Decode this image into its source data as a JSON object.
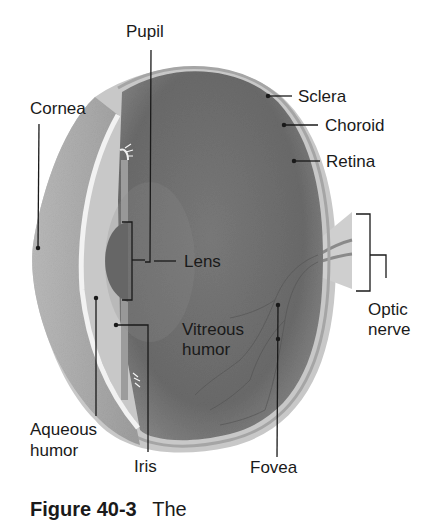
{
  "diagram": {
    "colors": {
      "background": "#ffffff",
      "vitreous": "#6e6e6e",
      "sclera": "#bdbdbd",
      "cornea": "#a8a8a8",
      "lens": "#555555",
      "leader_line": "#1a1a1a",
      "text": "#1a1a1a"
    },
    "labels": {
      "pupil": "Pupil",
      "cornea": "Cornea",
      "sclera": "Sclera",
      "choroid": "Choroid",
      "retina": "Retina",
      "lens": "Lens",
      "optic_nerve_1": "Optic",
      "optic_nerve_2": "nerve",
      "vitreous_1": "Vitreous",
      "vitreous_2": "humor",
      "aqueous_1": "Aqueous",
      "aqueous_2": "humor",
      "iris": "Iris",
      "fovea": "Fovea"
    },
    "caption": {
      "figure": "Figure 40-3",
      "text": "The"
    }
  }
}
